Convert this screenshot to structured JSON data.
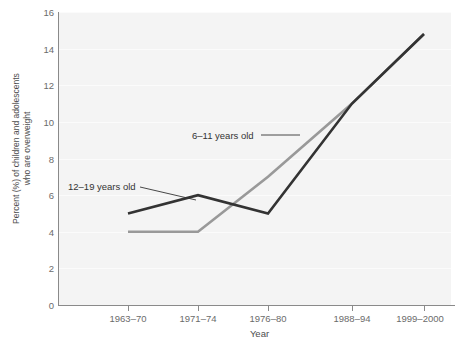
{
  "chart_data": {
    "type": "line",
    "title": "",
    "xlabel": "Year",
    "ylabel": "Percent (%) of children and adolescents\nwho are overweight",
    "categories": [
      "1963–70",
      "1971–74",
      "1976–80",
      "1988–94",
      "1999–2000"
    ],
    "ylim": [
      0,
      16
    ],
    "yticks": [
      0,
      2,
      4,
      6,
      8,
      10,
      12,
      14,
      16
    ],
    "ytick_labels": [
      "0",
      "2",
      "4",
      "6",
      "8",
      "10",
      "12",
      "14",
      "16"
    ],
    "grid": true,
    "legend_position": "inline-annotations",
    "series": [
      {
        "name": "6–11 years old",
        "color": "#999999",
        "values": [
          4,
          4,
          7,
          11,
          14.8
        ]
      },
      {
        "name": "12–19 years old",
        "color": "#333333",
        "values": [
          5,
          6,
          5,
          11,
          14.8
        ]
      }
    ],
    "annotations": [
      {
        "text": "6–11 years old",
        "series": "6–11 years old"
      },
      {
        "text": "12–19 years old",
        "series": "12–19 years old"
      }
    ]
  },
  "axes": {
    "y_title": "Percent (%) of children and adolescents\nwho are overweight",
    "x_title": "Year"
  },
  "colors": {
    "plot_background": "#f4f4f4",
    "axis": "#8a8a8a",
    "gridline": "#fbfbfb",
    "series_6_11": "#999999",
    "series_12_19": "#333333",
    "text": "#4d4d4d",
    "tick_text": "#6b6b6b"
  }
}
